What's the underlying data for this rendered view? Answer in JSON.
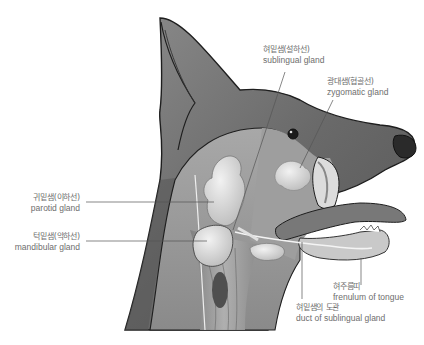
{
  "diagram": {
    "colors": {
      "fur": "#6f6f6f",
      "fur_dark": "#4a4a4a",
      "outline": "#1e1e1e",
      "gland": "#d8d8d8",
      "muscle": "#9a9a9a",
      "tongue": "#7a7a7a",
      "nose": "#2a2a2a",
      "leader_line": "#555555",
      "label_text": "#6e6e6e",
      "background": "#ffffff"
    },
    "labels": [
      {
        "id": "sublingual",
        "ko": "혀밑샘(설하선)",
        "en": "sublingual gland"
      },
      {
        "id": "zygomatic",
        "ko": "광대샘(협골선)",
        "en": "zygomatic gland"
      },
      {
        "id": "parotid",
        "ko": "귀밑샘(이하선)",
        "en": "parotid gland"
      },
      {
        "id": "mandibular",
        "ko": "턱밑샘(악하선)",
        "en": "mandibular gland"
      },
      {
        "id": "frenulum",
        "ko": "혀주름띠",
        "en": "frenulum of tongue"
      },
      {
        "id": "duct",
        "ko": "혀밑샘의 도관",
        "en": "duct of sublingual gland"
      }
    ]
  }
}
